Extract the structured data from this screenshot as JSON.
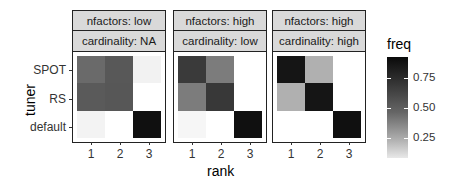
{
  "chart_data": {
    "type": "heatmap",
    "xlabel": "rank",
    "ylabel": "tuner",
    "x_categories": [
      "1",
      "2",
      "3"
    ],
    "y_categories": [
      "SPOT",
      "RS",
      "default"
    ],
    "legend": {
      "title": "freq",
      "ticks": [
        "0.75",
        "0.50",
        "0.25"
      ],
      "range": [
        0.08,
        0.93
      ]
    },
    "panels": [
      {
        "strip_top": "nfactors: low",
        "strip_bottom": "cardinality: NA",
        "values": [
          [
            0.55,
            0.62,
            0.06
          ],
          [
            0.62,
            0.62,
            0.0
          ],
          [
            0.05,
            0.0,
            0.92
          ]
        ],
        "colors": [
          [
            "#6a6a6a",
            "#585858",
            "#f2f2f2"
          ],
          [
            "#5a5a5a",
            "#575757",
            "#ffffff"
          ],
          [
            "#f3f3f3",
            "#ffffff",
            "#101010"
          ]
        ]
      },
      {
        "strip_top": "nfactors: high",
        "strip_bottom": "cardinality: low",
        "values": [
          [
            0.75,
            0.5,
            0.0
          ],
          [
            0.5,
            0.78,
            0.0
          ],
          [
            0.03,
            0.0,
            0.92
          ]
        ],
        "colors": [
          [
            "#3a3a3a",
            "#7c7c7c",
            "#ffffff"
          ],
          [
            "#7c7c7c",
            "#383838",
            "#ffffff"
          ],
          [
            "#f6f6f6",
            "#ffffff",
            "#101010"
          ]
        ]
      },
      {
        "strip_top": "nfactors: high",
        "strip_bottom": "cardinality: high",
        "values": [
          [
            0.9,
            0.3,
            0.0
          ],
          [
            0.3,
            0.9,
            0.0
          ],
          [
            0.0,
            0.0,
            0.92
          ]
        ],
        "colors": [
          [
            "#151515",
            "#b0b0b0",
            "#ffffff"
          ],
          [
            "#b0b0b0",
            "#151515",
            "#ffffff"
          ],
          [
            "#ffffff",
            "#ffffff",
            "#101010"
          ]
        ]
      }
    ]
  }
}
